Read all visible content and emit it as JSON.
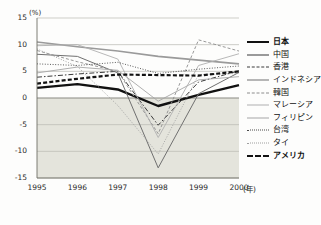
{
  "chart_data": {
    "type": "line",
    "title": "",
    "xlabel": "(年)",
    "ylabel": "(%)",
    "x": [
      1995,
      1996,
      1997,
      1998,
      1999,
      2000
    ],
    "xticklabels": [
      "1995",
      "1996",
      "1997",
      "1998",
      "1999",
      "2000"
    ],
    "xlim": [
      1995,
      2000
    ],
    "ylim": [
      -15,
      15
    ],
    "yticks": [
      15,
      10,
      5,
      0,
      -5,
      -10,
      -15
    ],
    "yticklabels": [
      "15",
      "10",
      "5",
      "0",
      "-5",
      "-10",
      "-15"
    ],
    "grid": true,
    "legend_position": "right",
    "negative_region_shaded": true,
    "series": [
      {
        "name": "日本",
        "values": [
          1.9,
          2.6,
          1.6,
          -1.5,
          0.6,
          2.4
        ],
        "color": "#111111",
        "width": 2.4,
        "dash": "none",
        "emphasis": true
      },
      {
        "name": "中国",
        "values": [
          10.5,
          9.6,
          8.8,
          7.8,
          7.1,
          6.4
        ],
        "color": "#9a9a9a",
        "width": 1.6,
        "dash": "none",
        "emphasis": false
      },
      {
        "name": "香港",
        "values": [
          3.9,
          4.5,
          5.0,
          -5.1,
          3.0,
          5.1
        ],
        "color": "#3a3a3a",
        "width": 1.0,
        "dash": "5,2,1.5,2",
        "emphasis": false
      },
      {
        "name": "インドネシア",
        "values": [
          8.2,
          7.8,
          4.7,
          -13.1,
          0.8,
          4.8
        ],
        "color": "#707070",
        "width": 1.0,
        "dash": "none",
        "emphasis": false
      },
      {
        "name": "韓国",
        "values": [
          8.9,
          6.8,
          5.0,
          -6.7,
          10.9,
          8.8
        ],
        "color": "#8c8c8c",
        "width": 0.9,
        "dash": "3,2",
        "emphasis": false
      },
      {
        "name": "マレーシア",
        "values": [
          9.8,
          10.0,
          7.3,
          -7.4,
          6.1,
          8.3
        ],
        "color": "#b0b0b0",
        "width": 0.9,
        "dash": "none",
        "emphasis": false
      },
      {
        "name": "フィリピン",
        "values": [
          4.7,
          5.8,
          5.2,
          -0.6,
          3.4,
          4.0
        ],
        "color": "#a6a6a6",
        "width": 0.9,
        "dash": "none",
        "emphasis": false
      },
      {
        "name": "台湾",
        "values": [
          6.4,
          6.1,
          6.7,
          4.6,
          5.4,
          6.0
        ],
        "color": "#4a4a4a",
        "width": 0.9,
        "dash": "1,1.6",
        "emphasis": false
      },
      {
        "name": "タイ",
        "values": [
          9.2,
          5.9,
          -1.4,
          -10.5,
          4.4,
          4.6
        ],
        "color": "#9e9e9e",
        "width": 0.9,
        "dash": "1,1.6",
        "emphasis": false
      },
      {
        "name": "アメリカ",
        "values": [
          2.7,
          3.6,
          4.4,
          4.3,
          4.2,
          5.0
        ],
        "color": "#121212",
        "width": 2.2,
        "dash": "4,2.2",
        "emphasis": true
      }
    ]
  },
  "legend": {
    "items": [
      {
        "label": "日本"
      },
      {
        "label": "中国"
      },
      {
        "label": "香港"
      },
      {
        "label": "インドネシア"
      },
      {
        "label": "韓国"
      },
      {
        "label": "マレーシア"
      },
      {
        "label": "フィリピン"
      },
      {
        "label": "台湾"
      },
      {
        "label": "タイ"
      },
      {
        "label": "アメリカ"
      }
    ]
  },
  "axes": {
    "y_unit": "(%)",
    "x_unit": "(年)"
  },
  "colors": {
    "plot_background": "#fdfdfc",
    "negative_shade": "#e4e4dc",
    "gridline": "#b9b9b1",
    "zeroline": "#8a8a82",
    "axis_text": "#2a2a2a"
  }
}
